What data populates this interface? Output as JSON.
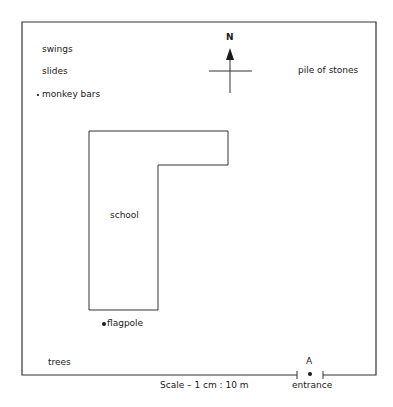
{
  "map": {
    "labels": {
      "swings": "swings",
      "slides": "slides",
      "monkey_bars": "monkey bars",
      "pile_of_stones": "pile of stones",
      "school": "school",
      "flagpole": "flagpole",
      "trees": "trees",
      "entrance": "entrance",
      "entrance_point": "A"
    },
    "compass": {
      "north_label": "N"
    },
    "scale": "Scale – 1 cm : 10 m",
    "colors": {
      "line": "#333333",
      "text": "#1a1a1a",
      "background": "#ffffff"
    }
  }
}
